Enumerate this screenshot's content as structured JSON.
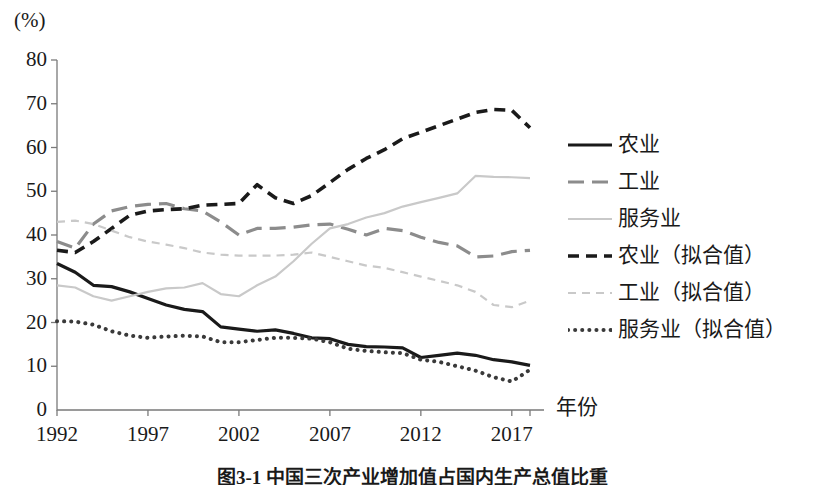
{
  "figure": {
    "unit_label": "(%)",
    "caption": "图3-1  中国三次产业增加值占国内生产总值比重"
  },
  "chart_data": {
    "type": "line",
    "title": "",
    "xlabel": "年份",
    "ylabel": "(%)",
    "xlim": [
      1992,
      2018
    ],
    "ylim": [
      0,
      80
    ],
    "ytick_step": 10,
    "yticks": [
      0,
      10,
      20,
      30,
      40,
      50,
      60,
      70,
      80
    ],
    "xticks": [
      1992,
      1997,
      2002,
      2007,
      2012,
      2017
    ],
    "grid": false,
    "legend_position": "right",
    "x": [
      1992,
      1993,
      1994,
      1995,
      1996,
      1997,
      1998,
      1999,
      2000,
      2001,
      2002,
      2003,
      2004,
      2005,
      2006,
      2007,
      2008,
      2009,
      2010,
      2011,
      2012,
      2013,
      2014,
      2015,
      2016,
      2017,
      2018
    ],
    "series": [
      {
        "name": "农业",
        "style": "solid",
        "color": "#1a1a1a",
        "width": 3.2,
        "values": [
          33.5,
          31.5,
          28.5,
          28.2,
          27.0,
          25.5,
          24.0,
          23.0,
          22.5,
          19.0,
          18.5,
          18.0,
          18.3,
          17.5,
          16.5,
          16.3,
          15.0,
          14.5,
          14.4,
          14.2,
          12.0,
          12.5,
          13.0,
          12.5,
          11.5,
          11.0,
          10.2
        ]
      },
      {
        "name": "工业",
        "style": "dashed",
        "color": "#8c8c8c",
        "width": 3.2,
        "values": [
          38.5,
          37.0,
          42.5,
          45.5,
          46.5,
          47.0,
          47.2,
          46.0,
          45.5,
          43.0,
          40.0,
          41.5,
          41.5,
          41.8,
          42.3,
          42.5,
          41.3,
          40.0,
          41.5,
          41.0,
          39.5,
          38.3,
          37.5,
          35.0,
          35.2,
          36.2,
          36.5
        ]
      },
      {
        "name": "服务业",
        "style": "solid",
        "color": "#c9c9c9",
        "width": 2.2,
        "values": [
          28.5,
          28.0,
          26.0,
          25.0,
          26.0,
          27.0,
          27.8,
          28.0,
          29.0,
          26.5,
          26.0,
          28.5,
          30.5,
          34.0,
          38.0,
          41.5,
          42.5,
          44.0,
          45.0,
          46.5,
          47.5,
          48.5,
          49.5,
          53.5,
          53.3,
          53.2,
          53.0
        ]
      },
      {
        "name": "农业（拟合值）",
        "style": "dashed-bold",
        "color": "#1a1a1a",
        "width": 3.6,
        "values": [
          36.5,
          36.0,
          38.5,
          41.5,
          44.5,
          45.5,
          45.8,
          46.0,
          46.8,
          47.0,
          47.2,
          51.5,
          48.5,
          47.2,
          49.0,
          52.0,
          55.0,
          57.5,
          59.5,
          62.0,
          63.5,
          65.0,
          66.5,
          68.0,
          68.7,
          68.5,
          64.5
        ]
      },
      {
        "name": "工业（拟合值）",
        "style": "dashed-fine",
        "color": "#c9c9c9",
        "width": 2.2,
        "values": [
          43.0,
          43.3,
          42.5,
          41.0,
          39.5,
          38.5,
          37.8,
          37.0,
          36.0,
          35.5,
          35.3,
          35.3,
          35.3,
          35.5,
          36.0,
          35.0,
          34.0,
          33.0,
          32.5,
          31.5,
          30.5,
          29.5,
          28.5,
          27.0,
          24.0,
          23.5,
          25.0
        ]
      },
      {
        "name": "服务业（拟合值）",
        "style": "dotted",
        "color": "#3a3a3a",
        "width": 4.0,
        "values": [
          20.3,
          20.2,
          19.5,
          18.0,
          17.0,
          16.5,
          16.8,
          17.0,
          16.8,
          15.5,
          15.5,
          16.0,
          16.5,
          16.5,
          16.3,
          15.5,
          14.0,
          13.5,
          13.2,
          13.0,
          11.5,
          11.0,
          10.0,
          9.0,
          7.5,
          6.5,
          9.2
        ]
      }
    ]
  },
  "legend": {
    "items": [
      {
        "label": "农业",
        "swatch": "solid-black"
      },
      {
        "label": "工业",
        "swatch": "dashed-gray"
      },
      {
        "label": "服务业",
        "swatch": "solid-lightgray"
      },
      {
        "label": "农业（拟合值）",
        "swatch": "dashed-bold-black"
      },
      {
        "label": "工业（拟合值）",
        "swatch": "dashed-fine-lightgray"
      },
      {
        "label": "服务业（拟合值）",
        "swatch": "dotted-darkgray"
      }
    ]
  },
  "axis": {
    "y_labels": [
      "80",
      "70",
      "60",
      "50",
      "40",
      "30",
      "20",
      "10",
      "0"
    ],
    "x_labels": [
      "1992",
      "1997",
      "2002",
      "2007",
      "2012",
      "2017"
    ]
  }
}
